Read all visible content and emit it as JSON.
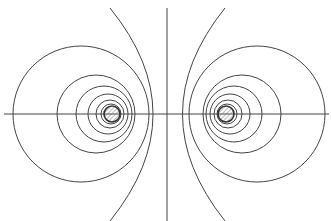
{
  "diagram": {
    "type": "two-conductor field pattern (Apollonius circles)",
    "stroke_color": "#444444",
    "hatch_color": "#777777",
    "axis": {
      "y": 114,
      "x1": 4,
      "x2": 329
    },
    "symmetry_line": {
      "x": 167,
      "y1": 8,
      "y2": 221
    },
    "left_conductor": {
      "cx": 112,
      "cy": 114,
      "r": 8
    },
    "right_conductor": {
      "cx": 226,
      "cy": 114,
      "r": 8
    },
    "left_circles": [
      {
        "cx": 81,
        "cy": 114,
        "r": 68
      },
      {
        "cx": 96,
        "cy": 114,
        "r": 39
      },
      {
        "cx": 104,
        "cy": 114,
        "r": 28
      },
      {
        "cx": 108,
        "cy": 114,
        "r": 20
      },
      {
        "cx": 110,
        "cy": 114,
        "r": 14
      },
      {
        "cx": 111,
        "cy": 114,
        "r": 10
      }
    ],
    "right_circles": [
      {
        "cx": 257,
        "cy": 114,
        "r": 68
      },
      {
        "cx": 242,
        "cy": 114,
        "r": 39
      },
      {
        "cx": 234,
        "cy": 114,
        "r": 28
      },
      {
        "cx": 230,
        "cy": 114,
        "r": 20
      },
      {
        "cx": 228,
        "cy": 114,
        "r": 14
      },
      {
        "cx": 227,
        "cy": 114,
        "r": 10
      }
    ],
    "outer_arcs": [
      {
        "name": "left-outer-arc",
        "d": "M 110 8 Q 196 114 110 221"
      },
      {
        "name": "right-outer-arc",
        "d": "M 225 8 Q 140 114 225 221"
      }
    ]
  }
}
